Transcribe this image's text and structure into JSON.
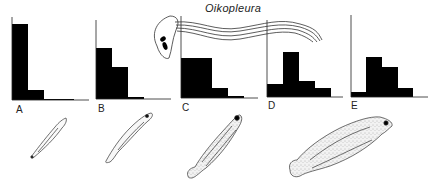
{
  "figure": {
    "title": "Oikopleura",
    "bar_color": "#000000",
    "line_color": "#222222",
    "larva_fill": "#eaeaea"
  },
  "chart_data": [
    {
      "type": "bar",
      "panel": "A",
      "title": "A",
      "categories": [
        "1",
        "2",
        "3",
        "4"
      ],
      "values": [
        76,
        10,
        1,
        1
      ],
      "axis": {
        "x": 12,
        "baseline": 100,
        "top": 17,
        "x_end": 89
      },
      "bins_px": [
        [
          12,
          28
        ],
        [
          28,
          44
        ],
        [
          44,
          60
        ],
        [
          60,
          74
        ]
      ]
    },
    {
      "type": "bar",
      "panel": "B",
      "title": "B",
      "categories": [
        "1",
        "2",
        "3",
        "4"
      ],
      "values": [
        51,
        32,
        2,
        0
      ],
      "axis": {
        "x": 96,
        "baseline": 99,
        "top": 20,
        "x_end": 171
      },
      "bins_px": [
        [
          96,
          112
        ],
        [
          112,
          128
        ],
        [
          128,
          144
        ],
        [
          144,
          158
        ]
      ]
    },
    {
      "type": "bar",
      "panel": "C",
      "title": "C",
      "categories": [
        "1",
        "2",
        "3",
        "4"
      ],
      "values": [
        40,
        40,
        10,
        2
      ],
      "axis": {
        "x": 181,
        "baseline": 98,
        "top": 16,
        "x_end": 258
      },
      "bins_px": [
        [
          181,
          196
        ],
        [
          196,
          212
        ],
        [
          212,
          228
        ],
        [
          228,
          244
        ]
      ]
    },
    {
      "type": "bar",
      "panel": "D",
      "title": "D",
      "categories": [
        "1",
        "2",
        "3",
        "4"
      ],
      "values": [
        13,
        45,
        16,
        9
      ],
      "axis": {
        "x": 267,
        "baseline": 97,
        "top": 20,
        "x_end": 343
      },
      "bins_px": [
        [
          267,
          283
        ],
        [
          283,
          299
        ],
        [
          299,
          315
        ],
        [
          315,
          331
        ]
      ]
    },
    {
      "type": "bar",
      "panel": "E",
      "title": "E",
      "categories": [
        "1",
        "2",
        "3",
        "4"
      ],
      "values": [
        5,
        40,
        30,
        9
      ],
      "axis": {
        "x": 351,
        "baseline": 97,
        "top": 15,
        "x_end": 428
      },
      "bins_px": [
        [
          351,
          366
        ],
        [
          366,
          382
        ],
        [
          382,
          398
        ],
        [
          398,
          413
        ]
      ]
    }
  ],
  "panels": [
    {
      "label": "A",
      "label_x": 16,
      "label_y": 105
    },
    {
      "label": "B",
      "label_x": 98,
      "label_y": 104
    },
    {
      "label": "C",
      "label_x": 182,
      "label_y": 103
    },
    {
      "label": "D",
      "label_x": 268,
      "label_y": 101
    },
    {
      "label": "E",
      "label_x": 351,
      "label_y": 101
    }
  ],
  "larvae": [
    {
      "stage": "A",
      "description": "slender early fish larva"
    },
    {
      "stage": "B",
      "description": "slender larva with eye"
    },
    {
      "stage": "C",
      "description": "larger stippled larva"
    },
    {
      "stage": "D",
      "description": "broad stippled flatfish larva"
    }
  ]
}
